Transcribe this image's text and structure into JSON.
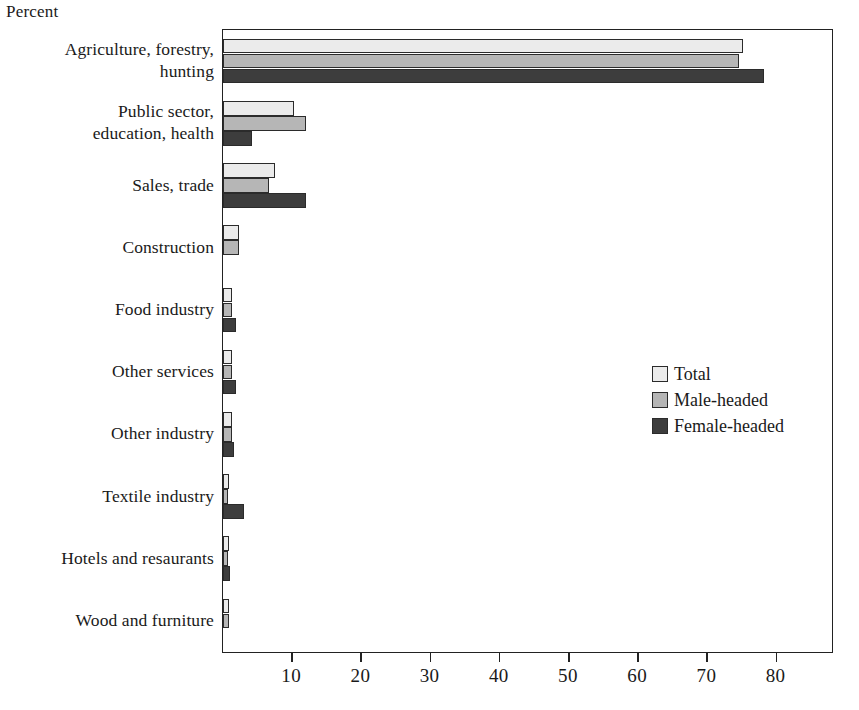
{
  "chart_data": {
    "type": "bar",
    "orientation": "horizontal",
    "title": "",
    "xlabel": "Percent",
    "ylabel": "",
    "xlim": [
      0,
      88
    ],
    "grid": false,
    "legend_position": "middle-right",
    "ticks": [
      10,
      20,
      30,
      40,
      50,
      60,
      70,
      80
    ],
    "categories": [
      "Agriculture, forestry, hunting",
      "Public sector, education, health",
      "Sales, trade",
      "Construction",
      "Food industry",
      "Other services",
      "Other industry",
      "Textile industry",
      "Hotels and resaurants",
      "Wood and furniture"
    ],
    "category_lines": [
      [
        "Agriculture, forestry,",
        "hunting"
      ],
      [
        "Public sector,",
        "education, health"
      ],
      [
        "Sales, trade",
        ""
      ],
      [
        "Construction",
        ""
      ],
      [
        "Food industry",
        ""
      ],
      [
        "Other services",
        ""
      ],
      [
        "Other industry",
        ""
      ],
      [
        "Textile industry",
        ""
      ],
      [
        "Hotels and resaurants",
        ""
      ],
      [
        "Wood and furniture",
        ""
      ]
    ],
    "series": [
      {
        "name": "Total",
        "color": "#ebebeb",
        "values": [
          75.2,
          10.2,
          7.5,
          2.3,
          1.3,
          1.3,
          1.3,
          0.9,
          0.8,
          0.8
        ]
      },
      {
        "name": "Male-headed",
        "color": "#b6b6b6",
        "values": [
          74.6,
          12.0,
          6.6,
          2.3,
          1.3,
          1.3,
          1.3,
          0.7,
          0.7,
          0.8
        ]
      },
      {
        "name": "Female-headed",
        "color": "#3d3d3d",
        "values": [
          78.2,
          4.2,
          12.0,
          0.0,
          1.9,
          1.9,
          1.6,
          3.0,
          1.0,
          0.0
        ]
      }
    ]
  },
  "axis": {
    "percent_caption": "Percent",
    "tick_labels": [
      "10",
      "20",
      "30",
      "40",
      "50",
      "60",
      "70",
      "80"
    ]
  },
  "legend": {
    "items": [
      {
        "label": "Total",
        "color": "#ebebeb"
      },
      {
        "label": "Male-headed",
        "color": "#b6b6b6"
      },
      {
        "label": "Female-headed",
        "color": "#3d3d3d"
      }
    ]
  }
}
